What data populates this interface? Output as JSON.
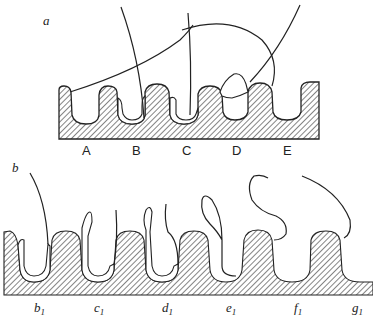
{
  "figure": {
    "panel_a": {
      "label": "a",
      "position_labels": [
        "A",
        "B",
        "C",
        "D",
        "E"
      ]
    },
    "panel_b": {
      "label": "b",
      "position_labels": [
        "b",
        "c",
        "d",
        "e",
        "f",
        "g"
      ],
      "subscript": "1"
    },
    "colors": {
      "ink": "#222222",
      "background": "#ffffff"
    }
  }
}
